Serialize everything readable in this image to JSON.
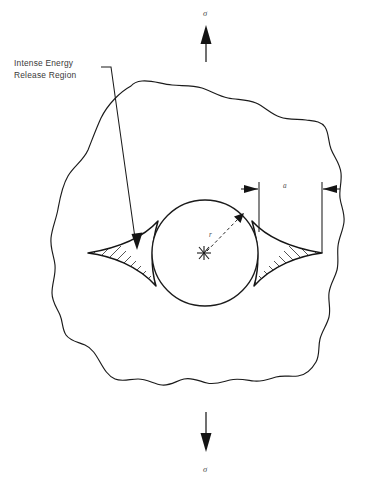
{
  "figure": {
    "background_color": "#ffffff",
    "line_color": "#1b1b1b",
    "text_color": "#3a3a3a"
  },
  "annotations": {
    "callout": {
      "line_1": "Intense Energy",
      "line_2": "Release Region"
    },
    "stress_top": "σ",
    "stress_bottom": "σ",
    "radius": "r",
    "crack_half_length": "a"
  },
  "elements": {
    "plate_name": "irregular-plate-outline",
    "circle_name": "inclusion-circle",
    "left_zone_name": "left-energy-release-zone",
    "right_zone_name": "right-energy-release-zone",
    "top_load_name": "tensile-load-arrow-top",
    "bottom_load_name": "tensile-load-arrow-bottom",
    "dimension_name": "crack-length-dimension"
  }
}
